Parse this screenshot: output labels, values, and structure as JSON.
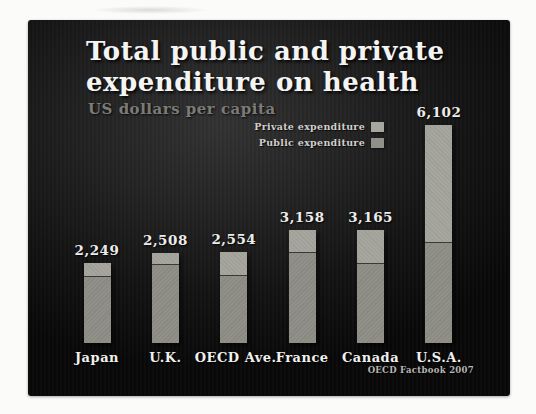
{
  "slide": {
    "title_line1": "Total public and private",
    "title_line2": "expenditure on health",
    "subtitle": "US dollars per capita",
    "credit": "OECD Factbook 2007",
    "colors": {
      "slide_bg_center": "#333232",
      "slide_bg_edge": "#090808",
      "title": "#f4f4f4",
      "subtitle": "#7b7b78",
      "value_label": "#ececea",
      "country_label": "#f0f0ee",
      "legend_text": "#cfcfcd",
      "credit_text": "#b7b7b4",
      "private_fill": "#a6a69e",
      "public_fill": "#908f88",
      "divider": "#3a3a33"
    }
  },
  "legend": {
    "items": [
      {
        "name": "private-expenditure",
        "label": "Private expenditure",
        "swatch": "#a6a69e"
      },
      {
        "name": "public-expenditure",
        "label": "Public expenditure",
        "swatch": "#908f88"
      }
    ]
  },
  "chart_data": {
    "type": "bar",
    "stacked": true,
    "title": "Total public and private expenditure on health",
    "ylabel": "US dollars per capita",
    "source": "OECD Factbook 2007",
    "categories": [
      "Japan",
      "U.K.",
      "OECD Ave.",
      "France",
      "Canada",
      "U.S.A."
    ],
    "totals": [
      2249,
      2508,
      2554,
      3158,
      3165,
      6102
    ],
    "total_labels": [
      "2,249",
      "2,508",
      "2,554",
      "3,158",
      "3,165",
      "6,102"
    ],
    "series": [
      {
        "name": "Public expenditure",
        "values": [
          1855,
          2170,
          1865,
          2527,
          2202,
          2800
        ],
        "estimated_from_bar_split": true
      },
      {
        "name": "Private expenditure",
        "values": [
          394,
          338,
          689,
          631,
          963,
          3302
        ],
        "estimated_from_bar_split": true
      }
    ],
    "ylim": [
      0,
      6500
    ],
    "grid": false,
    "legend_position": "upper-center-right",
    "value_labels_shown": true
  }
}
